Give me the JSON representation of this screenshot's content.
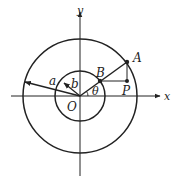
{
  "diagram": {
    "type": "concentric-circles-parametric",
    "axes": {
      "x_label": "x",
      "y_label": "y"
    },
    "labels": {
      "origin": "O",
      "outer_point": "A",
      "inner_point": "B",
      "point": "P",
      "outer_radius": "a",
      "inner_radius": "b",
      "angle": "θ"
    },
    "colors": {
      "stroke": "#222222",
      "background": "#ffffff"
    }
  }
}
